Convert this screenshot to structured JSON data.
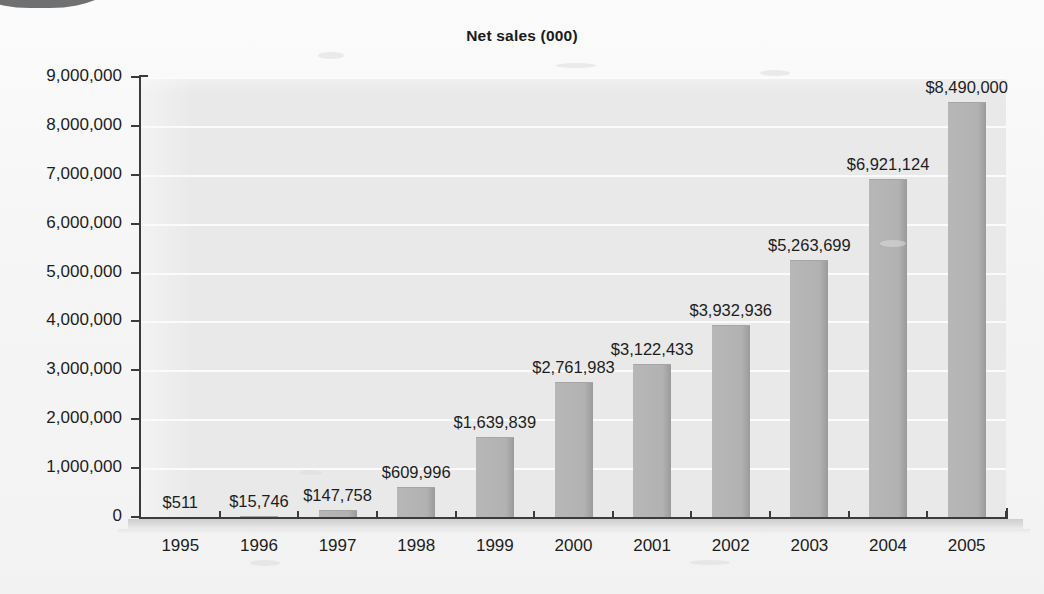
{
  "chart_data": {
    "type": "bar",
    "title": "Net sales (000)",
    "xlabel": "",
    "ylabel": "",
    "categories": [
      "1995",
      "1996",
      "1997",
      "1998",
      "1999",
      "2000",
      "2001",
      "2002",
      "2003",
      "2004",
      "2005"
    ],
    "values": [
      511,
      15746,
      147758,
      609996,
      1639839,
      2761983,
      3122433,
      3932936,
      5263699,
      6921124,
      8490000
    ],
    "data_labels": [
      "$511",
      "$15,746",
      "$147,758",
      "$609,996",
      "$1,639,839",
      "$2,761,983",
      "$3,122,433",
      "$3,932,936",
      "$5,263,699",
      "$6,921,124",
      "$8,490,000"
    ],
    "ylim": [
      0,
      9000000
    ],
    "ytick_labels": [
      "9,000,000",
      "8,000,000",
      "7,000,000",
      "6,000,000",
      "5,000,000",
      "4,000,000",
      "3,000,000",
      "2,000,000",
      "1,000,000",
      "0"
    ],
    "ytick_values": [
      9000000,
      8000000,
      7000000,
      6000000,
      5000000,
      4000000,
      3000000,
      2000000,
      1000000,
      0
    ],
    "grid": true,
    "legend": false,
    "colors": {
      "bar_fill": "#b4b4b4",
      "bar_edge": "#9a9a9a",
      "plot_background": "#e9e9e9",
      "gridline": "#fbfbfb",
      "axis": "#3b3b3b",
      "text": "#1d1d1d",
      "page_background": "#f6f6f6"
    }
  }
}
